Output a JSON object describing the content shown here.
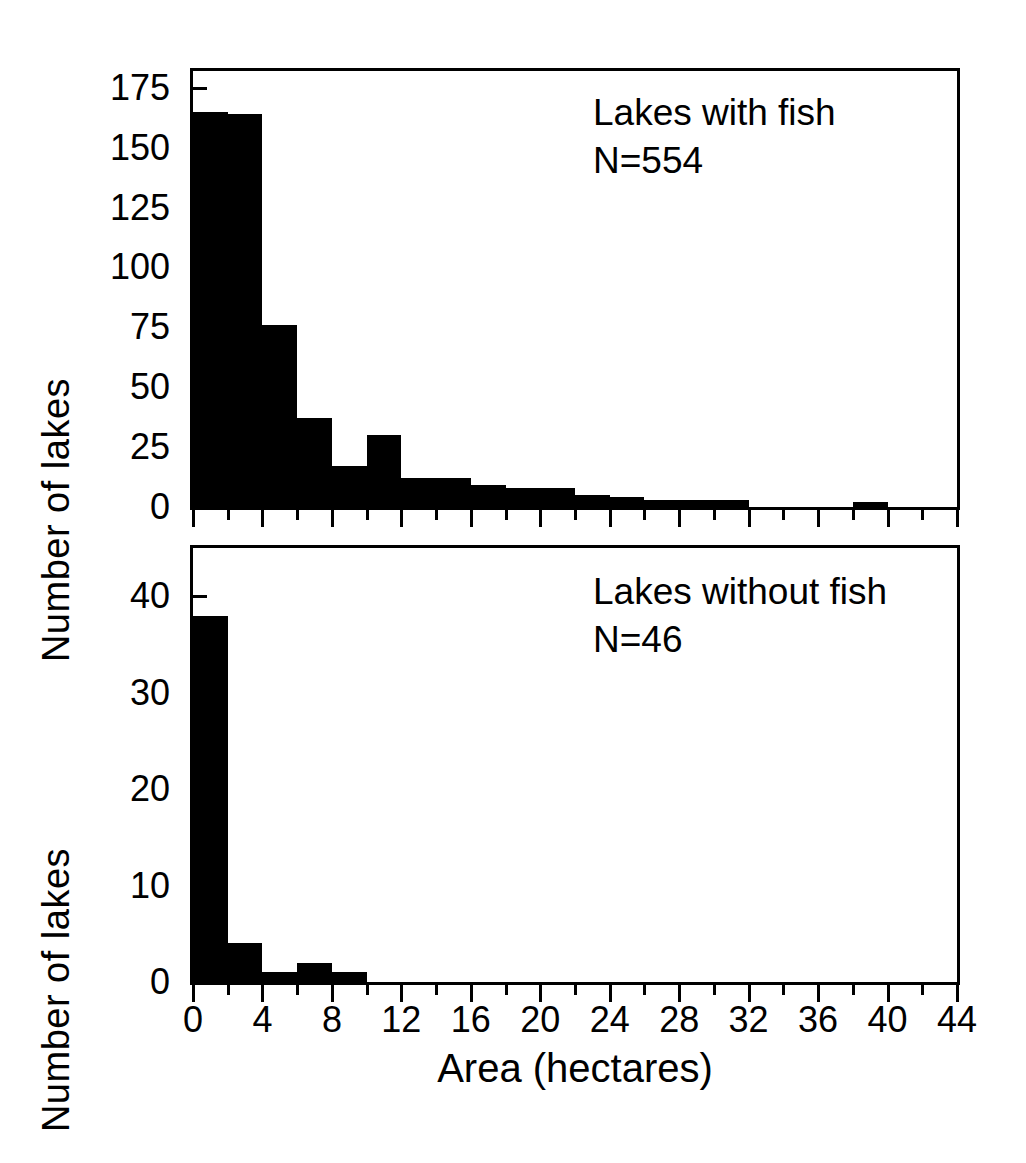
{
  "figure": {
    "xlabel": "Area (hectares)",
    "ylabel": "Number of lakes"
  },
  "panels": {
    "top": {
      "annotation_line1": "Lakes with fish",
      "annotation_line2": "N=554",
      "ytick_labels": [
        "0",
        "25",
        "50",
        "75",
        "100",
        "125",
        "150",
        "175"
      ]
    },
    "bottom": {
      "annotation_line1": "Lakes without fish",
      "annotation_line2": "N=46",
      "ytick_labels": [
        "0",
        "10",
        "20",
        "30",
        "40"
      ]
    }
  },
  "xaxis": {
    "tick_labels": [
      "0",
      "4",
      "8",
      "12",
      "16",
      "20",
      "24",
      "28",
      "32",
      "36",
      "40",
      "44"
    ]
  },
  "chart_data": [
    {
      "type": "bar",
      "title": "Lakes with fish",
      "subtitle": "N=554",
      "xlabel": "Area (hectares)",
      "ylabel": "Number of lakes",
      "xlim": [
        0,
        44
      ],
      "ylim": [
        0,
        182
      ],
      "bin_width": 2,
      "grid": false,
      "legend": null,
      "categories": [
        "0-2",
        "2-4",
        "4-6",
        "6-8",
        "8-10",
        "10-12",
        "12-14",
        "14-16",
        "16-18",
        "18-20",
        "20-22",
        "22-24",
        "24-26",
        "26-28",
        "28-30",
        "30-32",
        "32-34",
        "34-36",
        "36-38",
        "38-40",
        "40-42",
        "42-44"
      ],
      "bin_starts": [
        0,
        2,
        4,
        6,
        8,
        10,
        12,
        14,
        16,
        18,
        20,
        22,
        24,
        26,
        28,
        30,
        32,
        34,
        36,
        38,
        40,
        42
      ],
      "values": [
        165,
        164,
        76,
        37,
        17,
        30,
        12,
        12,
        9,
        8,
        8,
        5,
        4,
        3,
        3,
        3,
        0,
        0,
        0,
        2,
        0,
        0
      ],
      "ytick_values": [
        0,
        25,
        50,
        75,
        100,
        125,
        150,
        175
      ],
      "xtick_values": [
        0,
        4,
        8,
        12,
        16,
        20,
        24,
        28,
        32,
        36,
        40,
        44
      ]
    },
    {
      "type": "bar",
      "title": "Lakes without fish",
      "subtitle": "N=46",
      "xlabel": "Area (hectares)",
      "ylabel": "Number of lakes",
      "xlim": [
        0,
        44
      ],
      "ylim": [
        0,
        45
      ],
      "bin_width": 2,
      "grid": false,
      "legend": null,
      "categories": [
        "0-2",
        "2-4",
        "4-6",
        "6-8",
        "8-10",
        "10-12",
        "12-14",
        "14-16",
        "16-18",
        "18-20",
        "20-22",
        "22-24",
        "24-26",
        "26-28",
        "28-30",
        "30-32",
        "32-34",
        "34-36",
        "36-38",
        "38-40",
        "40-42",
        "42-44"
      ],
      "bin_starts": [
        0,
        2,
        4,
        6,
        8,
        10,
        12,
        14,
        16,
        18,
        20,
        22,
        24,
        26,
        28,
        30,
        32,
        34,
        36,
        38,
        40,
        42
      ],
      "values": [
        38,
        4,
        1,
        2,
        1,
        0,
        0,
        0,
        0,
        0,
        0,
        0,
        0,
        0,
        0,
        0,
        0,
        0,
        0,
        0,
        0,
        0
      ],
      "ytick_values": [
        0,
        10,
        20,
        30,
        40
      ],
      "xtick_values": [
        0,
        4,
        8,
        12,
        16,
        20,
        24,
        28,
        32,
        36,
        40,
        44
      ]
    }
  ]
}
